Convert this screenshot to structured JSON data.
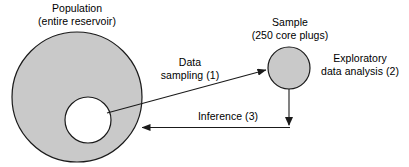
{
  "diagram": {
    "colors": {
      "shape_fill": "#c9c9c9",
      "shape_stroke": "#1a1a1a",
      "inner_fill": "#ffffff",
      "arrow": "#1a1a1a",
      "text": "#000000",
      "background": "#ffffff"
    },
    "shapes": {
      "population_circle": {
        "name": "population-circle",
        "cx": 77,
        "cy": 97,
        "r": 65,
        "fill": "#c9c9c9"
      },
      "population_inner_circle": {
        "name": "population-inner-circle",
        "cx": 88,
        "cy": 120,
        "r": 23,
        "fill": "#ffffff"
      },
      "sample_circle": {
        "name": "sample-circle",
        "cx": 289,
        "cy": 68,
        "r": 21,
        "fill": "#c9c9c9"
      }
    },
    "labels": {
      "population": {
        "line1": "Population",
        "line2": "(entire reservoir)"
      },
      "sample": {
        "line1": "Sample",
        "line2": "(250 core plugs)"
      },
      "data_sampling": {
        "line1": "Data",
        "line2": "sampling (1)"
      },
      "exploratory": {
        "line1": "Exploratory",
        "line2": "data analysis (2)"
      },
      "inference": {
        "line1": "Inference (3)"
      }
    },
    "arrows": {
      "data_sampling": {
        "name": "data-sampling-arrow",
        "from": {
          "x": 108,
          "y": 112
        },
        "to": {
          "x": 267,
          "y": 70
        },
        "direction": "population-to-sample"
      },
      "exploratory": {
        "name": "exploratory-analysis-arrow",
        "from": {
          "x": 289,
          "y": 89
        },
        "to": {
          "x": 289,
          "y": 126
        },
        "direction": "sample-downward"
      },
      "inference": {
        "name": "inference-arrow",
        "from": {
          "x": 289,
          "y": 127
        },
        "to": {
          "x": 141,
          "y": 127
        },
        "direction": "sample-to-population"
      }
    }
  }
}
